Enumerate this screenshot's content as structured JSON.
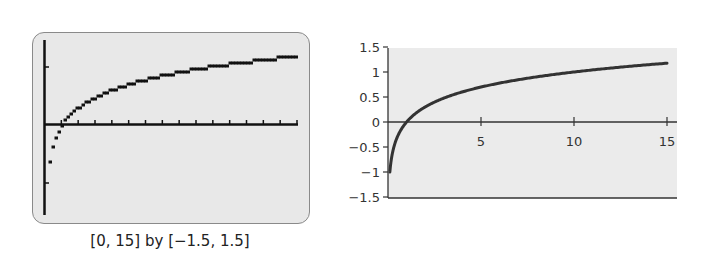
{
  "chart_data": [
    {
      "type": "line",
      "title": "",
      "subtitle": "Graphing calculator screen",
      "function": "y = log(x)",
      "caption": "[0, 15] by [−1.5, 1.5]",
      "xlim": [
        0,
        15
      ],
      "ylim": [
        -1.5,
        1.5
      ],
      "xticks": "every 1 unit (unlabeled)",
      "yticks": [
        -1,
        1
      ],
      "grid": false,
      "style": "pixelated step line",
      "x": [
        0.1,
        0.5,
        1,
        2,
        3,
        5,
        7,
        10,
        12,
        15
      ],
      "y": [
        -1.0,
        -0.3,
        0.0,
        0.3,
        0.48,
        0.7,
        0.85,
        1.0,
        1.08,
        1.18
      ]
    },
    {
      "type": "line",
      "title": "",
      "function": "y = log(x)",
      "xlabel": "",
      "ylabel": "",
      "xlim": [
        0,
        15.5
      ],
      "ylim": [
        -1.5,
        1.5
      ],
      "xtick_labels": [
        "5",
        "10",
        "15"
      ],
      "ytick_labels": [
        "1.5",
        "1",
        "0.5",
        "0",
        "−0.5",
        "−1",
        "−1.5"
      ],
      "grid": false,
      "legend": null,
      "x": [
        0.1,
        0.5,
        1,
        2,
        3,
        5,
        7,
        10,
        12,
        15
      ],
      "y": [
        -1.0,
        -0.3,
        0.0,
        0.3,
        0.48,
        0.7,
        0.85,
        1.0,
        1.08,
        1.18
      ]
    }
  ],
  "calculator": {
    "window_caption": "[0, 15] by [−1.5, 1.5]"
  },
  "plot": {
    "xtick_labels": [
      "5",
      "10",
      "15"
    ],
    "ytick_labels": [
      "1.5",
      "1",
      "0.5",
      "0",
      "−0.5",
      "−1",
      "−1.5"
    ]
  },
  "colors": {
    "curve": "#333333",
    "plot_background": "#ebebeb",
    "screen_background": "#e8e8e8"
  }
}
